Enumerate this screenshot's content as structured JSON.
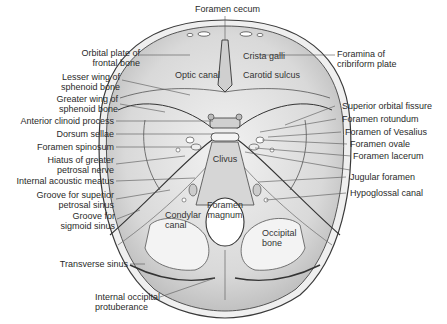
{
  "figure": {
    "labels_left": [
      {
        "id": "orbital-plate",
        "text": "Orbital plate of\nfrontal bone"
      },
      {
        "id": "lesser-wing",
        "text": "Lesser wing of\nsphenoid bone"
      },
      {
        "id": "greater-wing",
        "text": "Greater wing of\nsphenoid bone"
      },
      {
        "id": "anterior-clinoid",
        "text": "Anterior clinoid process"
      },
      {
        "id": "dorsum-sellae",
        "text": "Dorsum sellae"
      },
      {
        "id": "foramen-spinosum",
        "text": "Foramen spinosum"
      },
      {
        "id": "hiatus-greater-petrosal",
        "text": "Hiatus of greater\npetrosal nerve"
      },
      {
        "id": "internal-acoustic",
        "text": "Internal acoustic meatus"
      },
      {
        "id": "groove-superior-petrosal",
        "text": "Groove for superior\npetrosal sinus"
      },
      {
        "id": "groove-sigmoid",
        "text": "Groove for\nsigmoid sinus"
      },
      {
        "id": "transverse-sinus",
        "text": "Transverse sinus"
      },
      {
        "id": "internal-occipital",
        "text": "Internal occipital\nprotuberance"
      }
    ],
    "labels_right": [
      {
        "id": "foramina-cribriform",
        "text": "Foramina of\ncribriform plate"
      },
      {
        "id": "superior-orbital-fissure",
        "text": "Superior orbital fissure"
      },
      {
        "id": "foramen-rotundum",
        "text": "Foramen rotundum"
      },
      {
        "id": "foramen-vesalius",
        "text": "Foramen of Vesalius"
      },
      {
        "id": "foramen-ovale",
        "text": "Foramen ovale"
      },
      {
        "id": "foramen-lacerum",
        "text": "Foramen lacerum"
      },
      {
        "id": "jugular-foramen",
        "text": "Jugular foramen"
      },
      {
        "id": "hypoglossal-canal",
        "text": "Hypoglossal canal"
      }
    ],
    "labels_top": [
      {
        "id": "foramen-cecum",
        "text": "Foramen cecum"
      }
    ],
    "labels_inside": [
      {
        "id": "crista-galli",
        "text": "Crista galli"
      },
      {
        "id": "optic-canal",
        "text": "Optic canal"
      },
      {
        "id": "carotid-sulcus",
        "text": "Carotid sulcus"
      },
      {
        "id": "clivus",
        "text": "Clivus"
      },
      {
        "id": "foramen-magnum",
        "text": "Foramen\nmagnum"
      },
      {
        "id": "condylar-canal",
        "text": "Condylar\ncanal"
      },
      {
        "id": "occipital-bone",
        "text": "Occipital\nbone"
      }
    ],
    "colors": {
      "background": "#ffffff",
      "bone_fill": "#e4e4e4",
      "bone_shade": "#bdbdbd",
      "outline": "#3a3a3a",
      "leader": "#555555",
      "text": "#2a2a2a"
    }
  }
}
